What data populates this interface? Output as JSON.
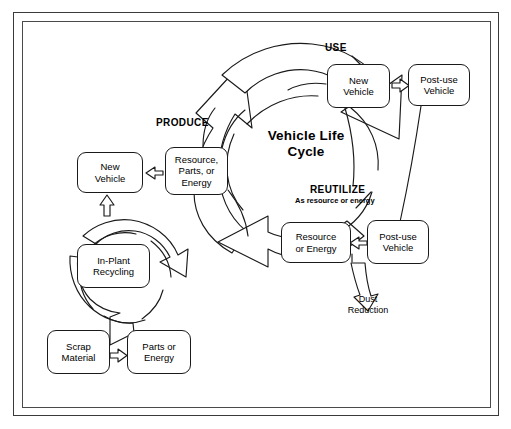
{
  "figure": {
    "title": "Vehicle Life Cycle",
    "type": "closed-loop recycling flow diagram"
  },
  "center": {
    "title_line1": "Vehicle Life",
    "title_line2": "Cycle",
    "title": "Vehicle Life\nCycle"
  },
  "phase_labels": [
    {
      "id": "produce",
      "text": "PRODUCE"
    },
    {
      "id": "use",
      "text": "USE"
    },
    {
      "id": "reutilize",
      "text": "REUTILIZE",
      "subtitle": "As resource or energy"
    }
  ],
  "nodes": [
    {
      "id": "new-vehicle-top",
      "text": "New\nVehicle"
    },
    {
      "id": "post-use-vehicle-top",
      "text": "Post-use\nVehicle"
    },
    {
      "id": "resource-parts-energy",
      "text": "Resource,\nParts, or\nEnergy"
    },
    {
      "id": "new-vehicle-left",
      "text": "New\nVehicle"
    },
    {
      "id": "resource-or-energy",
      "text": "Resource\nor Energy"
    },
    {
      "id": "post-use-vehicle-bottom",
      "text": "Post-use\nVehicle"
    },
    {
      "id": "in-plant-recycling",
      "text": "In-Plant\nRecycling"
    },
    {
      "id": "scrap-material",
      "text": "Scrap\nMaterial"
    },
    {
      "id": "parts-or-energy",
      "text": "Parts or\nEnergy"
    }
  ],
  "annotations": [
    {
      "id": "dust-reduction",
      "text": "Dust\nReduction"
    }
  ],
  "colors": {
    "stroke": "#1a1a1a",
    "frame": "#3a3a3a",
    "background": "#ffffff",
    "text": "#000000"
  }
}
